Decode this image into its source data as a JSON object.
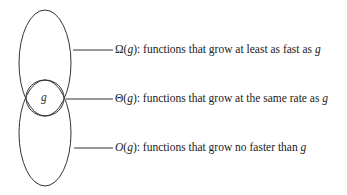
{
  "diagram": {
    "center_label": "g",
    "sets": [
      {
        "id": "omega",
        "symbol": "Ω",
        "arg": "g",
        "description": "functions that grow at least as fast as",
        "tail": "g"
      },
      {
        "id": "theta",
        "symbol": "Θ",
        "arg": "g",
        "description": "functions that grow at the same rate as",
        "tail": "g"
      },
      {
        "id": "bigo",
        "symbol": "O",
        "arg": "g",
        "description": "functions that grow no faster than",
        "tail": "g"
      }
    ]
  }
}
